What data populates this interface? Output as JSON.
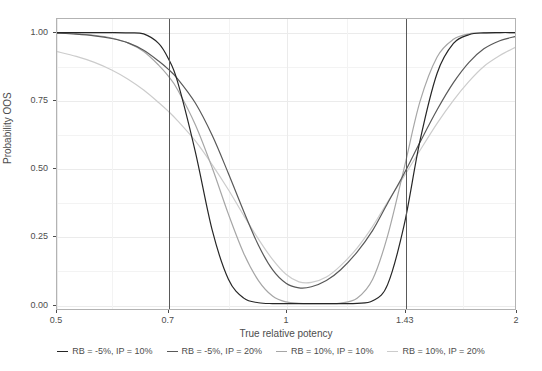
{
  "chart_data": {
    "type": "line",
    "title": "",
    "xlabel": "True relative potency",
    "ylabel": "Probability OOS",
    "xscale": "log",
    "xlim": [
      0.5,
      2
    ],
    "ylim": [
      -0.02,
      1.05
    ],
    "xticks": [
      "0.5",
      "0.7",
      "1",
      "1.43",
      "2"
    ],
    "xtick_values": [
      0.5,
      0.7,
      1,
      1.43,
      2
    ],
    "yticks": [
      "0.00",
      "0.25",
      "0.50",
      "0.75",
      "1.00"
    ],
    "ytick_values": [
      0,
      0.25,
      0.5,
      0.75,
      1
    ],
    "grid": true,
    "legend_position": "bottom",
    "reference_lines": [
      {
        "orientation": "vertical",
        "value": 0.7,
        "color": "#595959"
      },
      {
        "orientation": "vertical",
        "value": 1.43,
        "color": "#595959"
      }
    ],
    "x": [
      0.5,
      0.53,
      0.56,
      0.59,
      0.62,
      0.65,
      0.68,
      0.7,
      0.72,
      0.76,
      0.8,
      0.84,
      0.88,
      0.92,
      0.96,
      1.0,
      1.04,
      1.08,
      1.13,
      1.18,
      1.24,
      1.3,
      1.36,
      1.43,
      1.5,
      1.58,
      1.66,
      1.74,
      1.82,
      1.91,
      2.0
    ],
    "series": [
      {
        "name": "RB = -5%, IP = 10%",
        "color": "#262626",
        "values": [
          1.0,
          1.0,
          1.0,
          1.0,
          0.999,
          0.995,
          0.96,
          0.905,
          0.82,
          0.56,
          0.27,
          0.09,
          0.02,
          0.003,
          0.0,
          0.0,
          0.0,
          0.0,
          0.0,
          0.0,
          0.001,
          0.01,
          0.07,
          0.29,
          0.6,
          0.85,
          0.96,
          0.992,
          0.999,
          1.0,
          1.0
        ]
      },
      {
        "name": "RB = -5%, IP = 20%",
        "color": "#595959",
        "values": [
          0.998,
          0.994,
          0.988,
          0.978,
          0.962,
          0.935,
          0.895,
          0.865,
          0.83,
          0.74,
          0.62,
          0.48,
          0.34,
          0.215,
          0.125,
          0.075,
          0.058,
          0.062,
          0.085,
          0.125,
          0.19,
          0.27,
          0.37,
          0.48,
          0.595,
          0.715,
          0.815,
          0.89,
          0.94,
          0.97,
          0.985
        ]
      },
      {
        "name": "RB = 10%, IP = 10%",
        "color": "#a6a6a6",
        "values": [
          0.998,
          0.995,
          0.99,
          0.98,
          0.962,
          0.93,
          0.88,
          0.84,
          0.79,
          0.66,
          0.5,
          0.33,
          0.185,
          0.085,
          0.028,
          0.006,
          0.001,
          0.0,
          0.0,
          0.002,
          0.02,
          0.09,
          0.25,
          0.5,
          0.745,
          0.91,
          0.975,
          0.995,
          0.999,
          1.0,
          1.0
        ]
      },
      {
        "name": "RB = 10%, IP = 20%",
        "color": "#cccccc",
        "values": [
          0.93,
          0.912,
          0.89,
          0.862,
          0.828,
          0.788,
          0.742,
          0.71,
          0.675,
          0.6,
          0.512,
          0.42,
          0.325,
          0.238,
          0.163,
          0.108,
          0.08,
          0.078,
          0.098,
          0.14,
          0.205,
          0.285,
          0.375,
          0.47,
          0.565,
          0.665,
          0.75,
          0.82,
          0.875,
          0.915,
          0.945
        ]
      }
    ]
  },
  "legend": {
    "items": [
      {
        "label": "RB = -5%, IP = 10%",
        "color": "#262626"
      },
      {
        "label": "RB = -5%, IP = 20%",
        "color": "#595959"
      },
      {
        "label": "RB = 10%, IP = 10%",
        "color": "#a6a6a6"
      },
      {
        "label": "RB = 10%, IP = 20%",
        "color": "#cccccc"
      }
    ]
  },
  "axes": {
    "x_title": "True relative potency",
    "y_title": "Probability OOS"
  }
}
